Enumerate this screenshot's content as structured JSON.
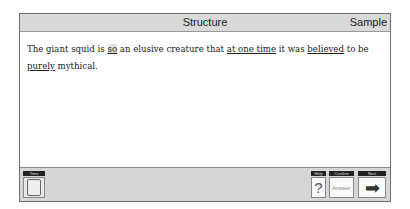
{
  "header": {
    "title": "Structure",
    "section": "Sample"
  },
  "question": {
    "segments": [
      {
        "text": "The giant squid is ",
        "style": "plain"
      },
      {
        "text": "so",
        "style": "underline-highlight"
      },
      {
        "text": " an elusive creature that ",
        "style": "plain"
      },
      {
        "text": "at one time",
        "style": "underline"
      },
      {
        "text": " it was ",
        "style": "plain"
      },
      {
        "text": "believed",
        "style": "underline"
      },
      {
        "text": " to be ",
        "style": "plain"
      },
      {
        "text": "purely",
        "style": "underline"
      },
      {
        "text": " mythical.",
        "style": "plain"
      }
    ]
  },
  "footer": {
    "time": {
      "label": "Time",
      "icon": "clock-icon"
    },
    "help": {
      "label": "Help",
      "glyph": "?"
    },
    "confirm": {
      "label": "Confirm",
      "button": "Answer"
    },
    "next": {
      "label": "Next",
      "glyph": "➡"
    }
  }
}
